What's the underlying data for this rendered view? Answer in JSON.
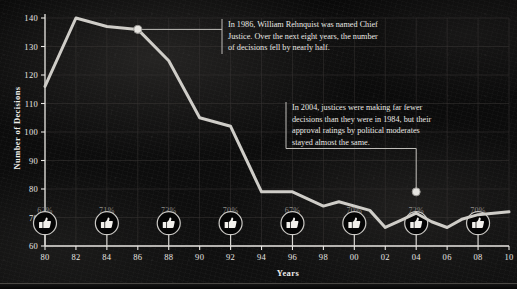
{
  "chart_data": {
    "type": "line",
    "title": "",
    "xlabel": "Years",
    "ylabel": "Number of Decisions",
    "xlim": [
      1980,
      2010
    ],
    "ylim": [
      60,
      140
    ],
    "grid": true,
    "legend": "none",
    "x_tick_labels": [
      "80",
      "82",
      "84",
      "86",
      "88",
      "90",
      "92",
      "94",
      "96",
      "98",
      "00",
      "02",
      "04",
      "06",
      "08",
      "10"
    ],
    "x_tick_values": [
      1980,
      1982,
      1984,
      1986,
      1988,
      1990,
      1992,
      1994,
      1996,
      1998,
      2000,
      2002,
      2004,
      2006,
      2008,
      2010
    ],
    "y_tick_labels": [
      "60",
      "70",
      "80",
      "90",
      "100",
      "110",
      "120",
      "130",
      "140"
    ],
    "y_tick_values": [
      60,
      70,
      80,
      90,
      100,
      110,
      120,
      130,
      140
    ],
    "series": [
      {
        "name": "Number of Decisions",
        "color": "#cfcdc8",
        "x": [
          1980,
          1982,
          1984,
          1986,
          1988,
          1990,
          1992,
          1994,
          1996,
          1998,
          1999,
          2001,
          2002,
          2003,
          2004,
          2005,
          2006,
          2007,
          2008,
          2009,
          2010
        ],
        "values": [
          116,
          140,
          137,
          136,
          125,
          105,
          102,
          79,
          79,
          74,
          75.5,
          72.5,
          66.5,
          69,
          71.5,
          68.5,
          66.5,
          69.5,
          71,
          71.5,
          72
        ]
      }
    ],
    "markers": [
      {
        "name": "marker-1986",
        "x": 1986,
        "y": 136,
        "label": "1986"
      },
      {
        "name": "marker-2004",
        "x": 2004,
        "y": 79,
        "label": "2004"
      }
    ],
    "approval_ratings": {
      "label": "approval rating by political moderates",
      "icon": "thumbs-up-icon",
      "points": [
        {
          "year": 1980,
          "value": "62%"
        },
        {
          "year": 1984,
          "value": "71%"
        },
        {
          "year": 1988,
          "value": "73%"
        },
        {
          "year": 1992,
          "value": "70%"
        },
        {
          "year": 1996,
          "value": "67%"
        },
        {
          "year": 2000,
          "value": "70%"
        },
        {
          "year": 2004,
          "value": "72%"
        },
        {
          "year": 2008,
          "value": "70%"
        }
      ]
    },
    "annotations": [
      {
        "name": "annotation-1986",
        "anchor_year": 1986,
        "lines": [
          "In 1986, William Rehnquist was named Chief",
          "Justice. Over the next eight years, the number",
          "of decisions fell by nearly half."
        ]
      },
      {
        "name": "annotation-2004",
        "anchor_year": 2004,
        "lines": [
          "In 2004, justices were making far fewer",
          "decisions than they were in 1984, but their",
          "approval ratings by political moderates",
          "stayed almost the same."
        ]
      }
    ]
  },
  "colors": {
    "line": "#cfcdc8",
    "axis": "#e8e6e2",
    "grid": "#3a3835",
    "pct_text": "#8e8c88",
    "annotation_text": "#e9e7e3",
    "background": "#0d0d0d"
  }
}
